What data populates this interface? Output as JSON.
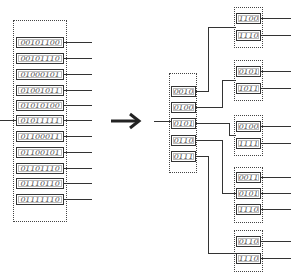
{
  "left_bucket": {
    "keys": [
      "00101100",
      "00101110",
      "01000101",
      "01001011",
      "01010100",
      "01011111",
      "01100011",
      "01100101",
      "01101110",
      "01110110",
      "01111110"
    ]
  },
  "arrow": {
    "icon": "right-arrow-icon",
    "glyph": "→"
  },
  "middle_bucket": {
    "keys": [
      "0010",
      "0100",
      "0101",
      "0110",
      "0111"
    ]
  },
  "right_buckets": [
    {
      "keys": [
        "1100",
        "1110"
      ]
    },
    {
      "keys": [
        "0101",
        "1011"
      ]
    },
    {
      "keys": [
        "0100",
        "1111"
      ]
    },
    {
      "keys": [
        "0011",
        "0101",
        "1110"
      ]
    },
    {
      "keys": [
        "0110",
        "1110"
      ]
    }
  ],
  "colors": {
    "line": "#333333",
    "text": "#555555",
    "background": "#ffffff"
  }
}
